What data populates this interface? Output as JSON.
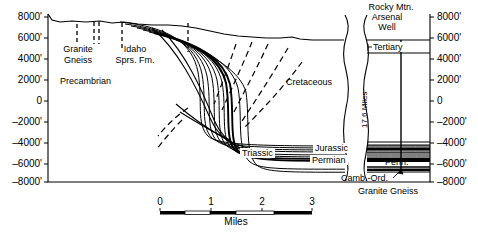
{
  "figure": {
    "kind": "geologic-cross-section",
    "title_block": {
      "lines": [
        "Rocky Mtn.",
        "Arsenal",
        "Well"
      ]
    }
  },
  "axes": {
    "left_ticks": [
      "8000'",
      "6000'",
      "4000'",
      "2000'",
      "0",
      "–2000'",
      "–4000'",
      "–6000'",
      "–8000'"
    ],
    "right_ticks": [
      "8000'",
      "6000'",
      "4000'",
      "2000'",
      "0",
      "–2000'",
      "–4000'",
      "–6000'",
      "–8000'"
    ],
    "elevation_values": [
      8000,
      6000,
      4000,
      2000,
      0,
      -2000,
      -4000,
      -6000,
      -8000
    ],
    "units": "feet"
  },
  "units_labels": {
    "granite_gneiss_left": [
      "Granite",
      "Gneiss"
    ],
    "idaho_springs": [
      "Idaho",
      "Sprs. Fm."
    ],
    "precambrian": "Precambrian",
    "cretaceous": "Cretaceous",
    "triassic": "Triassic",
    "jurassic": "Jurassic",
    "permian": "Permian",
    "tertiary": "Tertiary",
    "pennsylvanian": "Penn.",
    "cambrian_ordovician": "Camb.-Ord.",
    "granite_gneiss_right": "Granite  Gneiss"
  },
  "break": {
    "label": "17.6 Miles",
    "distance": 17.6,
    "units": "miles"
  },
  "scale_bar": {
    "ticks": [
      "0",
      "1",
      "2",
      "3"
    ],
    "values": [
      0,
      1,
      2,
      3
    ],
    "caption": "Miles"
  },
  "colors": {
    "ink": "#000000",
    "paper": "#ffffff"
  }
}
